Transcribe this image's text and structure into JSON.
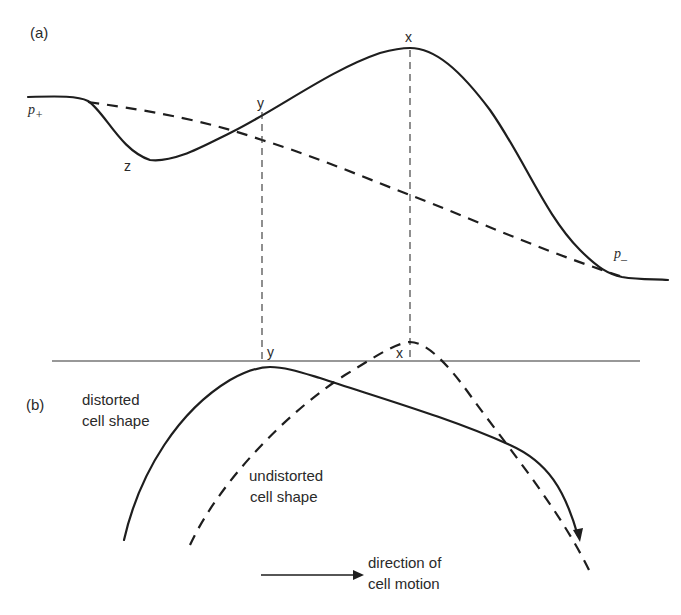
{
  "figure": {
    "panel_a": {
      "label": "(a)",
      "labels": {
        "p_plus": "p",
        "p_plus_sub": "+",
        "p_minus": "p",
        "p_minus_sub": "–",
        "z": "z",
        "y": "y",
        "x": "x"
      },
      "curves": [
        {
          "name": "solid-profile",
          "style": "solid",
          "description": "distorted profile from p+ through minimum z, up through y, peak x, down to p-"
        },
        {
          "name": "dashed-profile",
          "style": "dashed",
          "description": "undistorted monotone decreasing profile from p+ to p-"
        }
      ]
    },
    "panel_b": {
      "label": "(b)",
      "labels": {
        "y": "y",
        "x": "x"
      },
      "distorted_label_line1": "distorted",
      "distorted_label_line2": "cell shape",
      "undistorted_label_line1": "undistorted",
      "undistorted_label_line2": "cell shape"
    },
    "motion": {
      "label_line1": "direction of",
      "label_line2": "cell motion",
      "arrow": "right-arrow"
    },
    "colors": {
      "ink": "#1e1e1e",
      "background": "#ffffff"
    }
  }
}
